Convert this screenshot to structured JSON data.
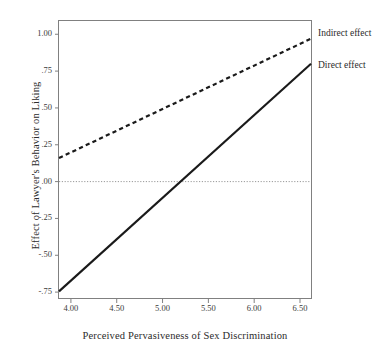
{
  "figure": {
    "background_color": "#ffffff",
    "foreground_color": "#2b2b2b"
  },
  "axes": {
    "x_title": "Perceived Pervasiveness of Sex Discrimination",
    "y_title": "Effect of Lawyer's Behavior on Liking",
    "x_ticks": [
      "4.00",
      "4.50",
      "5.00",
      "5.50",
      "6.00",
      "6.50"
    ],
    "y_ticks": [
      "1.00",
      ".75",
      ".50",
      ".25",
      ".00",
      "-.25",
      "-.50",
      "-.75"
    ]
  },
  "series_labels": {
    "indirect": "Indirect effect",
    "direct": "Direct effect"
  },
  "chart_data": {
    "type": "line",
    "title": "",
    "xlabel": "Perceived Pervasiveness of Sex Discrimination",
    "ylabel": "Effect of Lawyer's Behavior on Liking",
    "xlim": [
      3.87,
      6.62
    ],
    "ylim": [
      -0.79,
      1.09
    ],
    "xticks": [
      4.0,
      4.5,
      5.0,
      5.5,
      6.0,
      6.5
    ],
    "xticklabels": [
      "4.00",
      "4.50",
      "5.00",
      "5.50",
      "6.00",
      "6.50"
    ],
    "yticks": [
      1.0,
      0.75,
      0.5,
      0.25,
      0.0,
      -0.25,
      -0.5,
      -0.75
    ],
    "yticklabels": [
      "1.00",
      ".75",
      ".50",
      ".25",
      ".00",
      "-.25",
      "-.50",
      "-.75"
    ],
    "grid": false,
    "legend": "inline-right-annotations",
    "reference_lines": [
      {
        "name": "zero-line",
        "orientation": "horizontal",
        "value": 0.0,
        "style": "dotted",
        "color": "#999999"
      }
    ],
    "series": [
      {
        "name": "Indirect effect",
        "style": "dashed",
        "color": "#1a1a1a",
        "x": [
          3.87,
          6.62
        ],
        "y": [
          0.16,
          0.97
        ]
      },
      {
        "name": "Direct effect",
        "style": "solid",
        "color": "#1a1a1a",
        "x": [
          3.87,
          6.62
        ],
        "y": [
          -0.745,
          0.8
        ]
      }
    ]
  }
}
